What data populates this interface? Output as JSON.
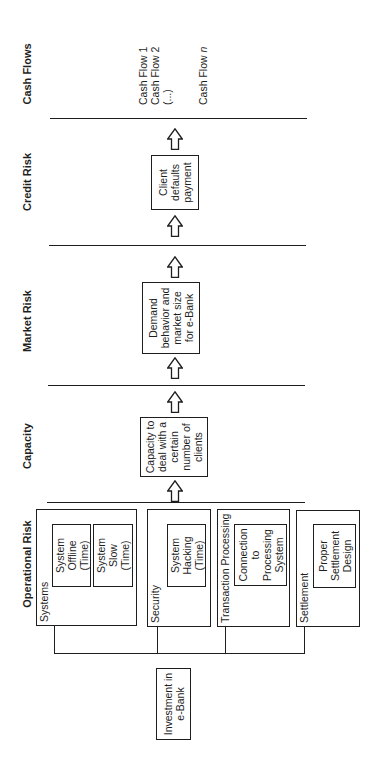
{
  "headers": {
    "operational": "Operational Risk",
    "capacity": "Capacity",
    "market": "Market Risk",
    "credit": "Credit Risk",
    "cash_flows": "Cash Flows"
  },
  "start_node": {
    "lines": [
      "Investment in",
      "e-Bank"
    ]
  },
  "operational_groups": [
    {
      "label": "Systems",
      "items": [
        {
          "lines": [
            "System",
            "Offline",
            "(Time)"
          ]
        },
        {
          "lines": [
            "System",
            "Slow",
            "(Time)"
          ]
        }
      ]
    },
    {
      "label": "Security",
      "items": [
        {
          "lines": [
            "System",
            "Hacking",
            "(Time)"
          ]
        }
      ]
    },
    {
      "label": "Transaction Processing",
      "items": [
        {
          "lines": [
            "Connection",
            "to",
            "Processing",
            "System"
          ]
        }
      ]
    },
    {
      "label": "Settlement",
      "items": [
        {
          "lines": [
            "Proper",
            "Settlement",
            "Design"
          ]
        }
      ]
    }
  ],
  "capacity_node": {
    "lines": [
      "Capacity to",
      "deal with a",
      "certain",
      "number of",
      "clients"
    ]
  },
  "market_node": {
    "lines": [
      "Demand",
      "behavior and",
      "market size",
      "for e-Bank"
    ]
  },
  "credit_node": {
    "lines": [
      "Client",
      "defaults",
      "payment"
    ]
  },
  "cash_flows": {
    "items": [
      "Cash Flow 1",
      "Cash Flow 2",
      "(...)"
    ],
    "last_prefix": "Cash Flow",
    "last_index": "n"
  },
  "icons": {
    "flow_arrow": "outline-arrow-right"
  },
  "colors": {
    "ink": "#1e1e1e",
    "background": "#ffffff"
  }
}
